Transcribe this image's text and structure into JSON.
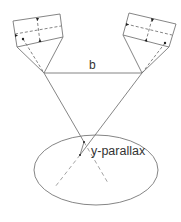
{
  "diagram": {
    "labels": {
      "baseline": "b",
      "parallax": "y-parallax"
    },
    "colors": {
      "stroke": "#777777",
      "dashed": "#999999",
      "text": "#333333",
      "background": "#ffffff"
    },
    "elements": {
      "left_camera": "tilted image frame with fiducial marks",
      "right_camera": "tilted image frame with fiducial marks",
      "baseline": "horizontal line between projection centers",
      "ground_area": "ellipse"
    }
  }
}
